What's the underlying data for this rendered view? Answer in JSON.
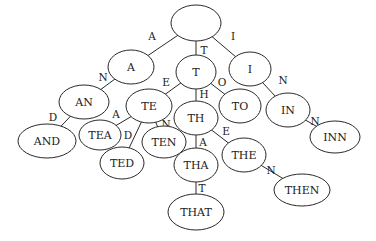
{
  "diagram": {
    "type": "trie",
    "nodes": [
      {
        "id": "root",
        "label": "",
        "cx": 196,
        "cy": 23,
        "rx": 25,
        "ry": 18
      },
      {
        "id": "A",
        "label": "A",
        "cx": 131,
        "cy": 67,
        "rx": 23,
        "ry": 17
      },
      {
        "id": "T",
        "label": "T",
        "cx": 196,
        "cy": 72,
        "rx": 20,
        "ry": 17
      },
      {
        "id": "I",
        "label": "I",
        "cx": 250,
        "cy": 69,
        "rx": 21,
        "ry": 17
      },
      {
        "id": "AN",
        "label": "AN",
        "cx": 84,
        "cy": 102,
        "rx": 25,
        "ry": 17
      },
      {
        "id": "TE",
        "label": "TE",
        "cx": 149,
        "cy": 106,
        "rx": 23,
        "ry": 17
      },
      {
        "id": "TO",
        "label": "TO",
        "cx": 240,
        "cy": 106,
        "rx": 21,
        "ry": 17
      },
      {
        "id": "IN",
        "label": "IN",
        "cx": 288,
        "cy": 110,
        "rx": 22,
        "ry": 17
      },
      {
        "id": "AND",
        "label": "AND",
        "cx": 47,
        "cy": 141,
        "rx": 29,
        "ry": 17
      },
      {
        "id": "TEA",
        "label": "TEA",
        "cx": 100,
        "cy": 135,
        "rx": 21,
        "ry": 15
      },
      {
        "id": "TED",
        "label": "TED",
        "cx": 122,
        "cy": 163,
        "rx": 22,
        "ry": 16
      },
      {
        "id": "TEN",
        "label": "TEN",
        "cx": 164,
        "cy": 142,
        "rx": 22,
        "ry": 16
      },
      {
        "id": "TH",
        "label": "TH",
        "cx": 196,
        "cy": 118,
        "rx": 22,
        "ry": 17
      },
      {
        "id": "INN",
        "label": "INN",
        "cx": 335,
        "cy": 137,
        "rx": 25,
        "ry": 16
      },
      {
        "id": "THA",
        "label": "THA",
        "cx": 196,
        "cy": 165,
        "rx": 22,
        "ry": 17
      },
      {
        "id": "THE",
        "label": "THE",
        "cx": 244,
        "cy": 155,
        "rx": 22,
        "ry": 17
      },
      {
        "id": "THEN",
        "label": "THEN",
        "cx": 302,
        "cy": 190,
        "rx": 28,
        "ry": 16
      },
      {
        "id": "THAT",
        "label": "THAT",
        "cx": 196,
        "cy": 212,
        "rx": 28,
        "ry": 18
      }
    ],
    "edges": [
      {
        "from": "root",
        "to": "A",
        "label": "A",
        "lx": 152,
        "ly": 36
      },
      {
        "from": "root",
        "to": "T",
        "label": "T",
        "lx": 204,
        "ly": 50
      },
      {
        "from": "root",
        "to": "I",
        "label": "I",
        "lx": 233,
        "ly": 36
      },
      {
        "from": "A",
        "to": "AN",
        "label": "N",
        "lx": 103,
        "ly": 77
      },
      {
        "from": "T",
        "to": "TE",
        "label": "E",
        "lx": 166,
        "ly": 82
      },
      {
        "from": "T",
        "to": "TO",
        "label": "O",
        "lx": 222,
        "ly": 82
      },
      {
        "from": "T",
        "to": "TH",
        "label": "H",
        "lx": 204,
        "ly": 94
      },
      {
        "from": "I",
        "to": "IN",
        "label": "N",
        "lx": 283,
        "ly": 80
      },
      {
        "from": "AN",
        "to": "AND",
        "label": "D",
        "lx": 53,
        "ly": 117
      },
      {
        "from": "TE",
        "to": "TEA",
        "label": "A",
        "lx": 116,
        "ly": 114
      },
      {
        "from": "TE",
        "to": "TED",
        "label": "D",
        "lx": 128,
        "ly": 135
      },
      {
        "from": "TE",
        "to": "TEN",
        "label": "N",
        "lx": 166,
        "ly": 124
      },
      {
        "from": "IN",
        "to": "INN",
        "label": "N",
        "lx": 315,
        "ly": 121
      },
      {
        "from": "TH",
        "to": "THA",
        "label": "A",
        "lx": 203,
        "ly": 142
      },
      {
        "from": "TH",
        "to": "THE",
        "label": "E",
        "lx": 226,
        "ly": 131
      },
      {
        "from": "THE",
        "to": "THEN",
        "label": "N",
        "lx": 271,
        "ly": 170
      },
      {
        "from": "THA",
        "to": "THAT",
        "label": "T",
        "lx": 202,
        "ly": 188
      }
    ]
  }
}
